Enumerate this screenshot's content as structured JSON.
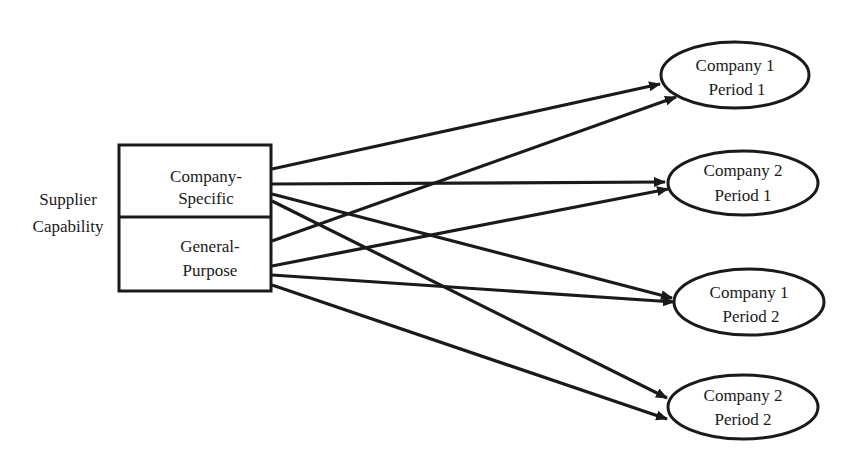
{
  "diagram": {
    "source_label": {
      "line1": "Supplier",
      "line2": "Capability"
    },
    "capabilities": [
      {
        "id": "company-specific",
        "line1": "Company-",
        "line2": "Specific"
      },
      {
        "id": "general-purpose",
        "line1": "General-",
        "line2": "Purpose"
      }
    ],
    "targets": [
      {
        "id": "c1p1",
        "line1": "Company 1",
        "line2": "Period 1"
      },
      {
        "id": "c2p1",
        "line1": "Company 2",
        "line2": "Period 1"
      },
      {
        "id": "c1p2",
        "line1": "Company 1",
        "line2": "Period 2"
      },
      {
        "id": "c2p2",
        "line1": "Company 2",
        "line2": "Period 2"
      }
    ],
    "edges": [
      {
        "from": "company-specific",
        "to": "c1p1"
      },
      {
        "from": "company-specific",
        "to": "c2p1"
      },
      {
        "from": "company-specific",
        "to": "c1p2"
      },
      {
        "from": "company-specific",
        "to": "c2p2"
      },
      {
        "from": "general-purpose",
        "to": "c1p1"
      },
      {
        "from": "general-purpose",
        "to": "c2p1"
      },
      {
        "from": "general-purpose",
        "to": "c1p2"
      },
      {
        "from": "general-purpose",
        "to": "c2p2"
      }
    ],
    "colors": {
      "stroke": "#1a1a1a",
      "background": "#ffffff"
    }
  }
}
